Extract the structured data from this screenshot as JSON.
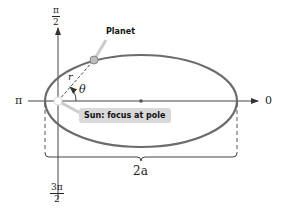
{
  "diagram": {
    "title": "",
    "axis_labels": {
      "top_num": "π",
      "top_den": "2",
      "bottom_num": "3π",
      "bottom_den": "2",
      "left": "π",
      "right": "0"
    },
    "labels": {
      "planet": "Planet",
      "sun": "Sun: focus at pole",
      "radius": "r",
      "angle": "θ",
      "major_axis": "2a"
    },
    "colors": {
      "ellipse": "#6b6b6b",
      "axes": "#444444",
      "sun_tag_bg": "#d9d9d9",
      "planet_fill": "#bdbdbd"
    }
  }
}
